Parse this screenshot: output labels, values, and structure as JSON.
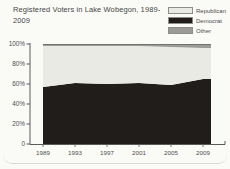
{
  "title": "Registered Voters in Lake Wobegon, 1989-2009",
  "legend": {
    "items": [
      {
        "label": "Republican",
        "color": "#eaeae5"
      },
      {
        "label": "Democrat",
        "color": "#211d1b"
      },
      {
        "label": "Other",
        "color": "#9b9a96"
      }
    ]
  },
  "chart_data": {
    "type": "area",
    "stacked": true,
    "title": "Registered Voters in Lake Wobegon, 1989-2009",
    "x": [
      1989,
      1993,
      1997,
      2001,
      2005,
      2009
    ],
    "x_tick_labels": [
      "1989",
      "1993",
      "1997",
      "2001",
      "2005",
      "2009"
    ],
    "y_ticks": [
      {
        "value": 100,
        "label": "100%"
      },
      {
        "value": 80,
        "label": "80%"
      },
      {
        "value": 60,
        "label": "60%"
      },
      {
        "value": 40,
        "label": "40%"
      },
      {
        "value": 20,
        "label": "20%"
      },
      {
        "value": 0,
        "label": "0"
      }
    ],
    "ylim": [
      0,
      100
    ],
    "grid": false,
    "legend_position": "top-right",
    "series": [
      {
        "name": "Democrat",
        "color": "#211d1b",
        "values": [
          57,
          61,
          60,
          61,
          59,
          65
        ]
      },
      {
        "name": "Republican",
        "color": "#eaeae5",
        "values": [
          41,
          37,
          38,
          37,
          38,
          31
        ]
      },
      {
        "name": "Other",
        "color": "#9b9a96",
        "values": [
          2,
          2,
          2,
          2,
          3,
          4
        ]
      }
    ],
    "axis_color": "#5a5a5a",
    "other_top_edge_color": "#73736f"
  }
}
